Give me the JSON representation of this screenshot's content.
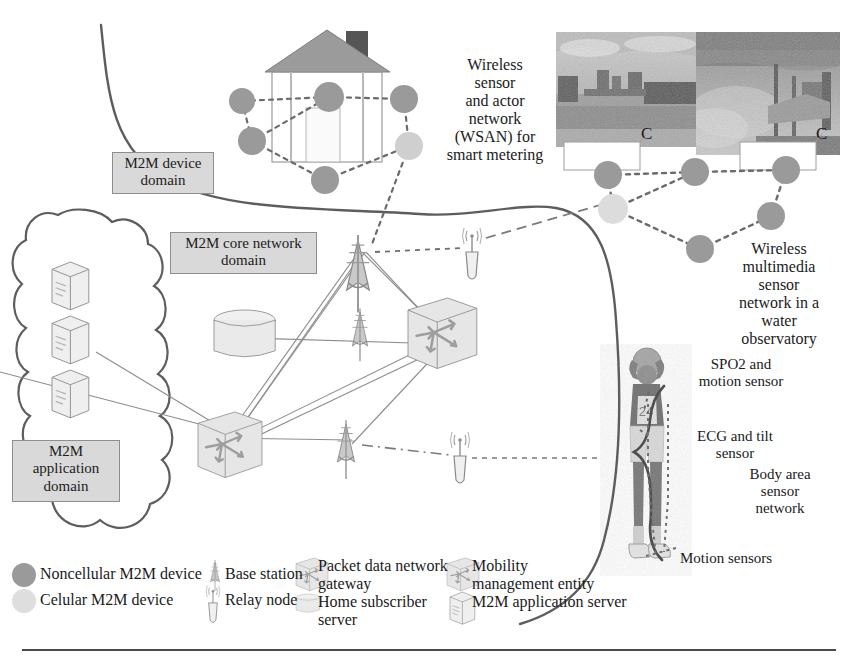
{
  "figure": {
    "background": "#ffffff",
    "rule_color": "#4a4a4a"
  },
  "palette": {
    "noncellular_node": "#9a9a9a",
    "cellular_node": "#cfcfcf",
    "domain_box_fill": "#d9d9d9",
    "domain_box_border": "#8e8e8e",
    "boundary_curve": "#5d5d5d",
    "link_line": "#8d8d8d",
    "dashed_link": "#6b6b6b",
    "equipment_fill": "#ededed",
    "equipment_stroke": "#7d7d7d",
    "arrow_gray": "#9b9b9b"
  },
  "domains": [
    {
      "id": "device",
      "lines": [
        "M2M device",
        "domain"
      ],
      "x": 112,
      "y": 152,
      "w": 100,
      "h": 38
    },
    {
      "id": "core",
      "lines": [
        "M2M core network",
        "domain"
      ],
      "x": 170,
      "y": 232,
      "w": 145,
      "h": 38
    },
    {
      "id": "application",
      "lines": [
        "M2M",
        "application",
        "domain"
      ],
      "x": 12,
      "y": 440,
      "w": 106,
      "h": 56
    }
  ],
  "annotations": [
    {
      "id": "wsan",
      "lines": [
        "Wireless",
        "sensor",
        "and actor",
        "network",
        "(WSAN) for",
        "smart metering"
      ],
      "x": 424,
      "y": 56,
      "w": 142,
      "font": 16
    },
    {
      "id": "wmsn",
      "lines": [
        "Wireless",
        "multimedia",
        "sensor",
        "network in a",
        "water",
        "observatory"
      ],
      "x": 716,
      "y": 240,
      "w": 126,
      "font": 16
    },
    {
      "id": "spo2",
      "lines": [
        "SPO2 and",
        "motion sensor"
      ],
      "x": 676,
      "y": 356,
      "w": 124,
      "font": 15
    },
    {
      "id": "ecg",
      "lines": [
        "ECG and tilt",
        "sensor"
      ],
      "x": 678,
      "y": 428,
      "w": 110,
      "font": 15
    },
    {
      "id": "basn",
      "lines": [
        "Body area",
        "sensor",
        "network"
      ],
      "x": 730,
      "y": 466,
      "w": 104,
      "font": 15
    },
    {
      "id": "motion",
      "lines": [
        "Motion sensors"
      ],
      "x": 684,
      "y": 550,
      "w": 140,
      "font": 15
    }
  ],
  "photo_callouts": [
    {
      "id": "callout-left",
      "label": "C",
      "x": 645,
      "y": 131
    },
    {
      "id": "callout-right",
      "label": "C",
      "x": 818,
      "y": 131
    }
  ],
  "photos": [
    {
      "id": "water-observatory-photo-left",
      "x": 556,
      "y": 32,
      "w": 140,
      "h": 115,
      "alt": "grayscale photo of a riverside water observatory station"
    },
    {
      "id": "water-observatory-photo-right",
      "x": 696,
      "y": 32,
      "w": 144,
      "h": 123,
      "alt": "grayscale photo of a water observatory sensor mast"
    }
  ],
  "person": {
    "id": "basketball-player",
    "alt": "grayscale photo of a basketball player holding a ball overhead",
    "x": 600,
    "y": 344,
    "w": 92,
    "h": 232,
    "jersey_number": "24"
  },
  "legend": {
    "columns": [
      {
        "id": "col-devices",
        "items": [
          {
            "id": "noncellular-m2m-device",
            "icon": "filled-circle-dark",
            "label": "Noncellular M2M device"
          },
          {
            "id": "celular-m2m-device",
            "icon": "filled-circle-light",
            "label": "Celular M2M device"
          }
        ]
      },
      {
        "id": "col-radio",
        "items": [
          {
            "id": "base-station",
            "icon": "tower-icon",
            "label": "Base station"
          },
          {
            "id": "relay-node",
            "icon": "relay-node-icon",
            "label": "Relay node"
          }
        ]
      },
      {
        "id": "col-core-a",
        "items": [
          {
            "id": "packet-data-network-gateway",
            "icon": "cube-icon",
            "label": "Packet data network gateway"
          },
          {
            "id": "home-subscriber-server",
            "icon": "cylinder-icon",
            "label": "Home subscriber server"
          }
        ]
      },
      {
        "id": "col-core-b",
        "items": [
          {
            "id": "mobility-management-entity",
            "icon": "cube-arrows-icon",
            "label": "Mobility management entity"
          },
          {
            "id": "m2m-application-server",
            "icon": "server-icon",
            "label": "M2M application server"
          }
        ]
      }
    ]
  },
  "nodes": {
    "wsan": [
      {
        "id": "wsan-n1",
        "type": "noncellular",
        "cx": 242,
        "cy": 101,
        "r": 13
      },
      {
        "id": "wsan-n2",
        "type": "noncellular",
        "cx": 252,
        "cy": 141,
        "r": 14
      },
      {
        "id": "wsan-n3",
        "type": "noncellular",
        "cx": 329,
        "cy": 97,
        "r": 15
      },
      {
        "id": "wsan-n4",
        "type": "noncellular",
        "cx": 404,
        "cy": 99,
        "r": 14
      },
      {
        "id": "wsan-n5",
        "type": "cellular",
        "cx": 409,
        "cy": 146,
        "r": 14
      },
      {
        "id": "wsan-n6",
        "type": "noncellular",
        "cx": 325,
        "cy": 180,
        "r": 14
      }
    ],
    "wmsn": [
      {
        "id": "wmsn-n1",
        "type": "noncellular",
        "cx": 608,
        "cy": 175,
        "r": 14
      },
      {
        "id": "wmsn-n2",
        "type": "noncellular",
        "cx": 695,
        "cy": 172,
        "r": 14
      },
      {
        "id": "wmsn-n3",
        "type": "noncellular",
        "cx": 786,
        "cy": 170,
        "r": 14
      },
      {
        "id": "wmsn-n4",
        "type": "cellular",
        "cx": 613,
        "cy": 209,
        "r": 15
      },
      {
        "id": "wmsn-n5",
        "type": "noncellular",
        "cx": 771,
        "cy": 216,
        "r": 14
      },
      {
        "id": "wmsn-n6",
        "type": "noncellular",
        "cx": 700,
        "cy": 249,
        "r": 14
      }
    ]
  },
  "equipment": [
    {
      "id": "base-station-tall",
      "kind": "tower",
      "x": 355,
      "y": 240
    },
    {
      "id": "base-station-mid",
      "kind": "tower",
      "x": 358,
      "y": 315
    },
    {
      "id": "base-station-low",
      "kind": "tower",
      "x": 343,
      "y": 425
    },
    {
      "id": "relay-node-upper",
      "kind": "relay",
      "x": 472,
      "y": 228
    },
    {
      "id": "relay-node-lower",
      "kind": "relay",
      "x": 458,
      "y": 437
    },
    {
      "id": "home-subscriber-server-core",
      "kind": "cylinder",
      "x": 215,
      "y": 310
    },
    {
      "id": "mobility-management-entity-core",
      "kind": "cube-arrows",
      "x": 410,
      "y": 300
    },
    {
      "id": "packet-data-network-gateway-core",
      "kind": "cube-arrows",
      "x": 200,
      "y": 415
    },
    {
      "id": "m2m-application-server-1",
      "kind": "server",
      "x": 52,
      "y": 265
    },
    {
      "id": "m2m-application-server-2",
      "kind": "server",
      "x": 52,
      "y": 318
    },
    {
      "id": "m2m-application-server-3",
      "kind": "server",
      "x": 52,
      "y": 371
    }
  ]
}
